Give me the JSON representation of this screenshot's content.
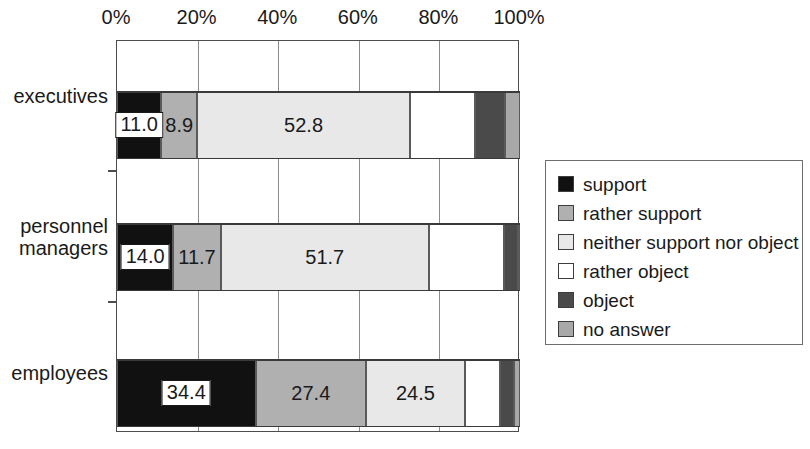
{
  "chart_data": {
    "type": "bar",
    "orientation": "horizontal",
    "stacked": true,
    "normalized_percent": true,
    "title": "",
    "subtitle": "",
    "xlabel": "",
    "ylabel": "",
    "xlim": [
      0,
      100
    ],
    "grid": true,
    "legend_position": "right",
    "categories": [
      "executives",
      "personnel\nmanagers",
      "employees"
    ],
    "xticks": [
      0,
      20,
      40,
      60,
      80,
      100
    ],
    "xtick_labels": [
      "0%",
      "20%",
      "40%",
      "60%",
      "80%",
      "100%"
    ],
    "series": [
      {
        "name": "support",
        "color": "#111111",
        "values": [
          11.0,
          14.0,
          34.4
        ],
        "labels": [
          "11.0",
          "14.0",
          "34.4"
        ],
        "label_boxed": [
          true,
          true,
          true
        ]
      },
      {
        "name": "rather support",
        "color": "#b0b0b0",
        "values": [
          8.9,
          11.7,
          27.4
        ],
        "labels": [
          "8.9",
          "11.7",
          "27.4"
        ],
        "label_boxed": [
          false,
          false,
          false
        ]
      },
      {
        "name": "neither support nor object",
        "color": "#e8e8e8",
        "values": [
          52.8,
          51.7,
          24.5
        ],
        "labels": [
          "52.8",
          "51.7",
          "24.5"
        ],
        "label_boxed": [
          false,
          false,
          false
        ]
      },
      {
        "name": "rather object",
        "color": "#ffffff",
        "values": [
          16.1,
          18.6,
          8.7
        ],
        "labels": [
          "",
          "",
          ""
        ],
        "label_boxed": [
          false,
          false,
          false
        ]
      },
      {
        "name": "object",
        "color": "#4a4a4a",
        "values": [
          7.4,
          3.6,
          3.5
        ],
        "labels": [
          "",
          "",
          ""
        ],
        "label_boxed": [
          false,
          false,
          false
        ]
      },
      {
        "name": "no answer",
        "color": "#a8a8a8",
        "values": [
          3.8,
          0.4,
          1.5
        ],
        "labels": [
          "",
          "",
          ""
        ],
        "label_boxed": [
          false,
          false,
          false
        ]
      }
    ]
  },
  "legend": {
    "items": [
      {
        "label": "support",
        "color": "#111111"
      },
      {
        "label": "rather support",
        "color": "#b0b0b0"
      },
      {
        "label": "neither support nor object",
        "color": "#e8e8e8"
      },
      {
        "label": "rather object",
        "color": "#ffffff"
      },
      {
        "label": "object",
        "color": "#4a4a4a"
      },
      {
        "label": "no answer",
        "color": "#a8a8a8"
      }
    ]
  },
  "axis": {
    "tick_labels": [
      "0%",
      "20%",
      "40%",
      "60%",
      "80%",
      "100%"
    ]
  },
  "categories": {
    "executives": "executives",
    "personnel_managers": "personnel\nmanagers",
    "employees": "employees"
  }
}
